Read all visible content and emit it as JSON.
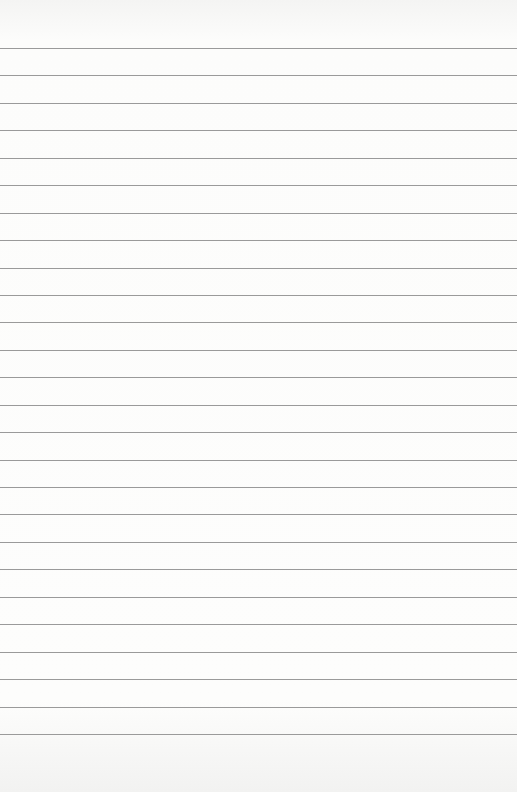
{
  "paper": {
    "type": "lined-paper",
    "line_count": 26,
    "first_line_y": 48,
    "line_spacing": 27.44,
    "line_color": "#9a9a9a",
    "background_color": "#fbfbfa"
  }
}
